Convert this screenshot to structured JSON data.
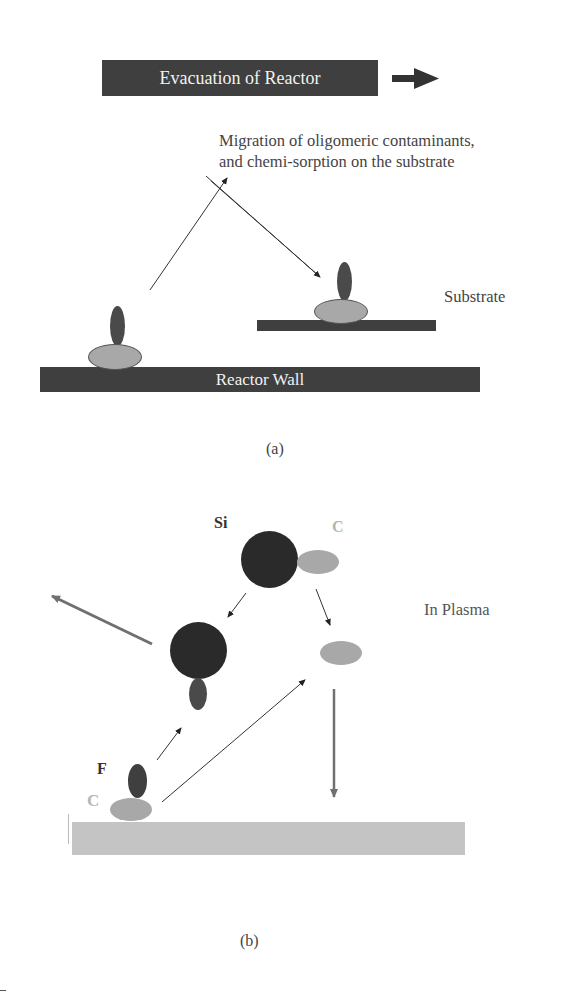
{
  "panel_a": {
    "evacuation_label": "Evacuation of Reactor",
    "migration_text_line1": "Migration of oligomeric contaminants,",
    "migration_text_line2": "and chemi-sorption on the substrate",
    "substrate_label": "Substrate",
    "reactor_wall_label": "Reactor Wall",
    "caption": "(a)"
  },
  "panel_b": {
    "si_label": "Si",
    "c_label_top": "C",
    "in_plasma_label": "In Plasma",
    "f_label": "F",
    "c_label_bottom": "C",
    "caption": "(b)"
  },
  "colors": {
    "dark_bar": "#3f3f3f",
    "dark_atom": "#2a2a2a",
    "f_atom": "#4a4a4a",
    "c_atom": "#a8a8a8",
    "surface_light": "#c4c4c4",
    "arrow_gray": "#707070"
  }
}
